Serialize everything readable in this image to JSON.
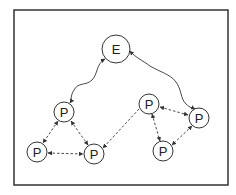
{
  "diagram": {
    "type": "network-graph",
    "frame": {
      "x": 14,
      "y": 10,
      "width": 214,
      "height": 175,
      "stroke": "#333333"
    },
    "nodes": [
      {
        "id": "E",
        "label": "E",
        "cx": 116,
        "cy": 49,
        "r": 14
      },
      {
        "id": "P1",
        "label": "P",
        "cx": 64,
        "cy": 112,
        "r": 10
      },
      {
        "id": "P2",
        "label": "P",
        "cx": 37,
        "cy": 152,
        "r": 10
      },
      {
        "id": "P3",
        "label": "P",
        "cx": 94,
        "cy": 154,
        "r": 10
      },
      {
        "id": "P4",
        "label": "P",
        "cx": 149,
        "cy": 104,
        "r": 10
      },
      {
        "id": "P5",
        "label": "P",
        "cx": 199,
        "cy": 118,
        "r": 10
      },
      {
        "id": "P6",
        "label": "P",
        "cx": 163,
        "cy": 151,
        "r": 10
      }
    ],
    "edges": [
      {
        "from": "E",
        "to": "P1",
        "style": "wavy-solid",
        "arrows": "both"
      },
      {
        "from": "E",
        "to": "P5",
        "style": "wavy-solid",
        "arrows": "both"
      },
      {
        "from": "P1",
        "to": "P2",
        "style": "dashed",
        "arrows": "both"
      },
      {
        "from": "P1",
        "to": "P3",
        "style": "dashed",
        "arrows": "both"
      },
      {
        "from": "P2",
        "to": "P3",
        "style": "dashed",
        "arrows": "both"
      },
      {
        "from": "P4",
        "to": "P3",
        "style": "dashed",
        "arrows": "end"
      },
      {
        "from": "P4",
        "to": "P5",
        "style": "dashed",
        "arrows": "both"
      },
      {
        "from": "P4",
        "to": "P6",
        "style": "dashed",
        "arrows": "both"
      },
      {
        "from": "P5",
        "to": "P6",
        "style": "dashed",
        "arrows": "both"
      }
    ]
  }
}
